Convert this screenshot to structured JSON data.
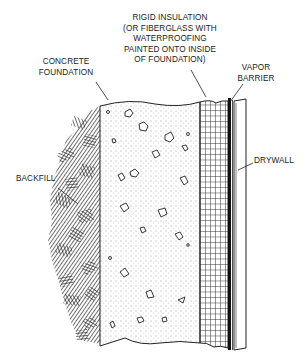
{
  "labels": {
    "rigid_insulation": [
      "RIGID INSULATION",
      "(OR FIBERGLASS WITH",
      "WATERPROOFING",
      "PAINTED ONTO INSIDE",
      "OF FOUNDATION)"
    ],
    "concrete_foundation": [
      "CONCRETE",
      "FOUNDATION"
    ],
    "vapor_barrier": [
      "VAPOR",
      "BARRIER"
    ],
    "backfill": "BACKFILL",
    "drywall": "DRYWALL"
  },
  "colors": {
    "line": "#222222",
    "background": "#ffffff"
  }
}
